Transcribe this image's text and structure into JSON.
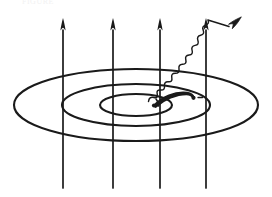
{
  "figure": {
    "title_fragment": "FIGURE",
    "background_color": "#ffffff",
    "ink_color": "#1a1a1a",
    "width": 272,
    "height": 197
  },
  "field_lines": {
    "label": "magnetic field lines",
    "count": 4,
    "direction": "up",
    "x_positions": [
      63,
      113,
      160,
      206
    ],
    "y_top": 18,
    "y_bottom": 188,
    "stroke_width": 1.6,
    "arrowhead": "spear"
  },
  "orbits": {
    "label": "concentric orbital ellipses",
    "count": 3,
    "center_x": 136,
    "center_y": 105,
    "rings": [
      {
        "name": "outer-orbit",
        "rx": 122,
        "ry": 36,
        "stroke_width": 2.0
      },
      {
        "name": "middle-orbit",
        "rx": 74,
        "ry": 21,
        "stroke_width": 2.0
      },
      {
        "name": "inner-orbit",
        "rx": 36,
        "ry": 11,
        "stroke_width": 2.0
      }
    ]
  },
  "electron_arc": {
    "label": "electron trajectory arc",
    "stroke_width_max": 4.5,
    "start_point": {
      "x": 154,
      "y": 104
    },
    "end_point": {
      "x": 193,
      "y": 98
    },
    "markers": [
      {
        "name": "arc-start-dot",
        "x": 154,
        "y": 104,
        "r": 2.0
      },
      {
        "name": "arc-end-dot",
        "x": 193,
        "y": 98,
        "r": 2.0
      }
    ],
    "particle_label": "e-"
  },
  "photon": {
    "label": "emitted photon (wavy arrow)",
    "wave_start": {
      "x": 149,
      "y": 100
    },
    "wave_end": {
      "x": 228,
      "y": 27
    },
    "amplitude": 3.2,
    "wavelength": 9.0,
    "stroke_width": 1.4,
    "arrowhead": "spear",
    "arrow_tip": {
      "x": 240,
      "y": 18
    }
  }
}
